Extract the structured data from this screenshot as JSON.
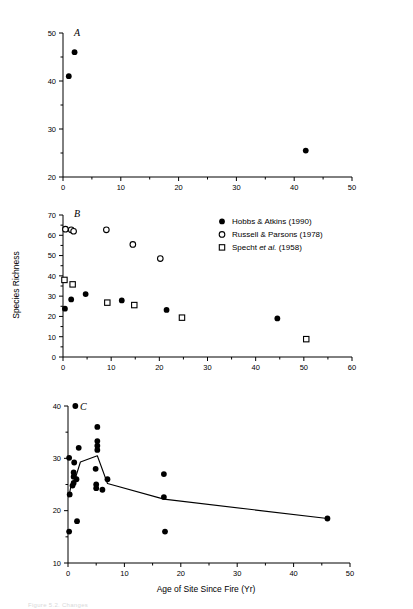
{
  "figure": {
    "xlabel": "Age of Site Since Fire (Yr)",
    "ylabel": "Species Richness",
    "caption_faint": "Figure 5.2.  Changes"
  },
  "legend": {
    "position": "top-right-of-panel-B",
    "entries": [
      {
        "marker": "filled-circle",
        "label_main": "Hobbs & Atkins (1990)",
        "label_pre": "Hobbs & Atkins (1990)",
        "label_italic": "",
        "label_post": ""
      },
      {
        "marker": "open-circle",
        "label_main": "Russell & Parsons (1978)",
        "label_pre": "Russell & Parsons (1978)",
        "label_italic": "",
        "label_post": ""
      },
      {
        "marker": "open-square",
        "label_main": "Specht et al. (1958)",
        "label_pre": "Specht ",
        "label_italic": "et al.",
        "label_post": " (1958)"
      }
    ]
  },
  "panels": {
    "A": {
      "letter": "A"
    },
    "B": {
      "letter": "B"
    },
    "C": {
      "letter": "C"
    }
  },
  "chart_data": [
    {
      "type": "scatter",
      "panel": "A",
      "title": "A",
      "xlabel": "Age of Site Since Fire (Yr)",
      "ylabel": "Species Richness",
      "xlim": [
        0,
        50
      ],
      "ylim": [
        20,
        50
      ],
      "xticks": [
        0,
        10,
        20,
        30,
        40,
        50
      ],
      "yticks": [
        20,
        30,
        40,
        50
      ],
      "xminorticks": [
        5,
        15,
        25,
        35,
        45
      ],
      "yminorticks": [
        25,
        35,
        45
      ],
      "grid": false,
      "legend": "none",
      "series": [
        {
          "name": "Hobbs & Atkins (1990)",
          "marker": "filled-circle",
          "points": [
            {
              "x": 1.0,
              "y": 41.0
            },
            {
              "x": 2.0,
              "y": 46.0
            },
            {
              "x": 42.0,
              "y": 25.5
            }
          ]
        }
      ]
    },
    {
      "type": "scatter",
      "panel": "B",
      "title": "B",
      "xlabel": "Age of Site Since Fire (Yr)",
      "ylabel": "Species Richness",
      "xlim": [
        0,
        60
      ],
      "ylim": [
        0,
        70
      ],
      "xticks": [
        0,
        10,
        20,
        30,
        40,
        50,
        60
      ],
      "yticks": [
        0,
        10,
        20,
        30,
        40,
        50,
        60,
        70
      ],
      "xminorticks": [
        5,
        15,
        25,
        35,
        45,
        55
      ],
      "yminorticks": [
        5,
        15,
        25,
        35,
        45,
        55,
        65
      ],
      "grid": false,
      "legend": "upper-right",
      "series": [
        {
          "name": "Hobbs & Atkins (1990)",
          "marker": "filled-circle",
          "points": [
            {
              "x": 0.4,
              "y": 23.8
            },
            {
              "x": 1.7,
              "y": 28.4
            },
            {
              "x": 4.7,
              "y": 31.0
            },
            {
              "x": 12.2,
              "y": 27.9
            },
            {
              "x": 21.5,
              "y": 23.2
            },
            {
              "x": 44.5,
              "y": 19.0
            }
          ]
        },
        {
          "name": "Russell & Parsons (1978)",
          "marker": "open-circle",
          "points": [
            {
              "x": 0.5,
              "y": 63.0
            },
            {
              "x": 1.7,
              "y": 62.7
            },
            {
              "x": 2.2,
              "y": 62.0
            },
            {
              "x": 9.0,
              "y": 62.7
            },
            {
              "x": 14.5,
              "y": 55.5
            },
            {
              "x": 20.2,
              "y": 48.5
            }
          ]
        },
        {
          "name": "Specht et al. (1958)",
          "marker": "open-square",
          "points": [
            {
              "x": 0.3,
              "y": 38.0
            },
            {
              "x": 2.0,
              "y": 35.8
            },
            {
              "x": 9.2,
              "y": 26.8
            },
            {
              "x": 14.8,
              "y": 25.6
            },
            {
              "x": 24.7,
              "y": 19.4
            },
            {
              "x": 50.5,
              "y": 8.8
            }
          ]
        }
      ]
    },
    {
      "type": "scatter",
      "panel": "C",
      "title": "C",
      "xlabel": "Age of Site Since Fire (Yr)",
      "ylabel": "Species Richness",
      "xlim": [
        0,
        50
      ],
      "ylim": [
        10,
        40
      ],
      "xticks": [
        0,
        10,
        20,
        30,
        40,
        50
      ],
      "yticks": [
        10,
        20,
        30,
        40
      ],
      "xminorticks": [
        5,
        15,
        25,
        35,
        45
      ],
      "yminorticks": [
        15,
        25,
        35
      ],
      "grid": false,
      "legend": "none",
      "series": [
        {
          "name": "Hobbs & Atkins (1990)",
          "marker": "filled-circle",
          "points": [
            {
              "x": 1.3,
              "y": 40.0
            },
            {
              "x": 0.2,
              "y": 30.1
            },
            {
              "x": 1.9,
              "y": 32.0
            },
            {
              "x": 1.1,
              "y": 29.2
            },
            {
              "x": 1.0,
              "y": 27.3
            },
            {
              "x": 1.0,
              "y": 26.5
            },
            {
              "x": 1.5,
              "y": 26.0
            },
            {
              "x": 1.0,
              "y": 25.3
            },
            {
              "x": 0.8,
              "y": 24.8
            },
            {
              "x": 0.3,
              "y": 23.1
            },
            {
              "x": 1.6,
              "y": 18.0
            },
            {
              "x": 0.2,
              "y": 16.0
            },
            {
              "x": 5.2,
              "y": 36.0
            },
            {
              "x": 5.2,
              "y": 33.3
            },
            {
              "x": 5.2,
              "y": 32.4
            },
            {
              "x": 5.2,
              "y": 31.6
            },
            {
              "x": 4.9,
              "y": 28.0
            },
            {
              "x": 5.0,
              "y": 25.0
            },
            {
              "x": 5.0,
              "y": 24.3
            },
            {
              "x": 6.1,
              "y": 24.0
            },
            {
              "x": 7.0,
              "y": 26.0
            },
            {
              "x": 17.0,
              "y": 27.0
            },
            {
              "x": 17.0,
              "y": 22.6
            },
            {
              "x": 17.2,
              "y": 16.0
            },
            {
              "x": 46.0,
              "y": 18.5
            }
          ]
        }
      ],
      "trend_line": {
        "name": "mean trend",
        "points": [
          {
            "x": 0.15,
            "y": 22.6
          },
          {
            "x": 0.5,
            "y": 24.6
          },
          {
            "x": 1.3,
            "y": 26.2
          },
          {
            "x": 2.2,
            "y": 29.3
          },
          {
            "x": 5.2,
            "y": 30.5
          },
          {
            "x": 7.0,
            "y": 25.2
          },
          {
            "x": 17.0,
            "y": 22.2
          },
          {
            "x": 46.0,
            "y": 18.5
          }
        ]
      }
    }
  ]
}
